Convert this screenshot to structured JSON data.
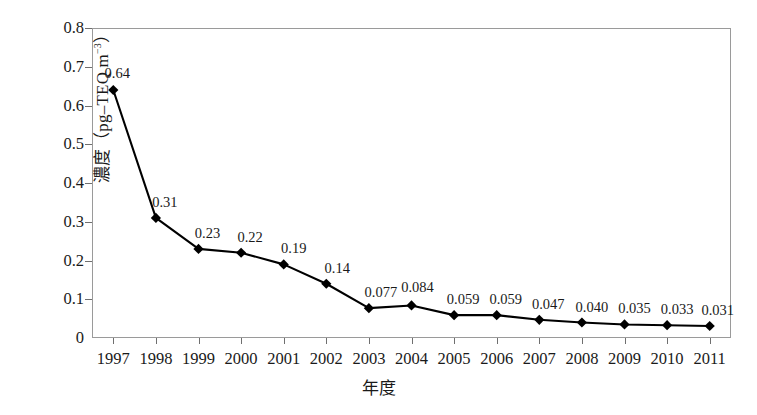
{
  "chart_data": {
    "type": "line",
    "title": "",
    "xlabel": "年度",
    "ylabel": "濃度（pg–TEQ m⁻³）",
    "ylabel_parts": {
      "prefix": "濃度（pg–TEQ m",
      "superscript": "−3",
      "suffix": "）"
    },
    "categories": [
      "1997",
      "1998",
      "1999",
      "2000",
      "2001",
      "2002",
      "2003",
      "2004",
      "2005",
      "2006",
      "2007",
      "2008",
      "2009",
      "2010",
      "2011"
    ],
    "values": [
      0.64,
      0.31,
      0.23,
      0.22,
      0.19,
      0.14,
      0.077,
      0.084,
      0.059,
      0.059,
      0.047,
      0.04,
      0.035,
      0.033,
      0.031
    ],
    "point_labels": [
      "0.64",
      "0.31",
      "0.23",
      "0.22",
      "0.19",
      "0.14",
      "0.077",
      "0.084",
      "0.059",
      "0.059",
      "0.047",
      "0.040",
      "0.035",
      "0.033",
      "0.031"
    ],
    "ylim": [
      0,
      0.8
    ],
    "yticks": [
      0,
      0.1,
      0.2,
      0.3,
      0.4,
      0.5,
      0.6,
      0.7,
      0.8
    ],
    "ytick_labels": [
      "0",
      "0.1",
      "0.2",
      "0.3",
      "0.4",
      "0.5",
      "0.6",
      "0.7",
      "0.8"
    ],
    "grid": false,
    "legend": null,
    "series_color": "#000000",
    "marker": "diamond",
    "frame_color": "#9a9a9a"
  }
}
